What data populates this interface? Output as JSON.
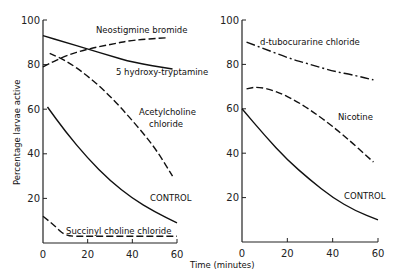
{
  "chart_data": [
    {
      "type": "line",
      "panel": "left",
      "xlabel": "Time (minutes)",
      "ylabel": "Percentage larvae active",
      "xlim": [
        0,
        60
      ],
      "ylim": [
        0,
        100
      ],
      "xticks": [
        "0",
        "20",
        "40",
        "60"
      ],
      "yticks": [
        "20",
        "40",
        "60",
        "80",
        "100"
      ],
      "grid": false,
      "series": [
        {
          "name": "Neostigmine bromide",
          "style": "dashed",
          "x": [
            0,
            10,
            20,
            30,
            40,
            55
          ],
          "values": [
            79,
            84,
            87,
            89,
            91,
            92
          ]
        },
        {
          "name": "5 hydroxy-tryptamine",
          "style": "solid",
          "x": [
            0,
            10,
            20,
            30,
            40,
            58
          ],
          "values": [
            93,
            90,
            87,
            84,
            81,
            78
          ]
        },
        {
          "name": "Acetylcholine chloride",
          "style": "dashed",
          "x": [
            3,
            10,
            20,
            30,
            40,
            50,
            58
          ],
          "values": [
            85,
            82,
            75,
            66,
            55,
            43,
            30
          ]
        },
        {
          "name": "CONTROL",
          "style": "solid",
          "x": [
            2,
            10,
            20,
            30,
            40,
            50,
            60
          ],
          "values": [
            61,
            50,
            38,
            28,
            20,
            14,
            9
          ]
        },
        {
          "name": "Succinyl choline chloride",
          "style": "dashed",
          "x": [
            0,
            5,
            10,
            20,
            40,
            60
          ],
          "values": [
            12,
            8,
            3,
            3,
            3,
            3
          ]
        }
      ]
    },
    {
      "type": "line",
      "panel": "right",
      "xlabel": "Time (minutes)",
      "xlim": [
        0,
        60
      ],
      "ylim": [
        0,
        100
      ],
      "xticks": [
        "0",
        "20",
        "40",
        "60"
      ],
      "yticks": [
        "20",
        "40",
        "60",
        "80",
        "100"
      ],
      "grid": false,
      "series": [
        {
          "name": "d-tubocurarine chloride",
          "style": "dash-dot",
          "x": [
            2,
            10,
            20,
            30,
            40,
            50,
            58
          ],
          "values": [
            90,
            87,
            83,
            80,
            77,
            75,
            73
          ]
        },
        {
          "name": "Nicotine",
          "style": "dashed",
          "x": [
            2,
            7,
            15,
            25,
            35,
            45,
            58
          ],
          "values": [
            69,
            70,
            68,
            63,
            56,
            48,
            36
          ]
        },
        {
          "name": "CONTROL",
          "style": "solid",
          "x": [
            0,
            10,
            20,
            30,
            40,
            50,
            60
          ],
          "values": [
            60,
            48,
            37,
            28,
            20,
            14,
            10
          ]
        }
      ]
    }
  ],
  "labels": {
    "neostigmine": "Neostigmine bromide",
    "hydroxy": "5 hydroxy-tryptamine",
    "acetyl1": "Acetylcholine",
    "acetyl2": "chloride",
    "control": "CONTROL",
    "succinyl": "Succinyl choline chloride",
    "tubocurarine": "d-tubocurarine chloride",
    "nicotine": "Nicotine",
    "ylabel": "Percentage larvae active",
    "xlabel": "Time (minutes)"
  }
}
